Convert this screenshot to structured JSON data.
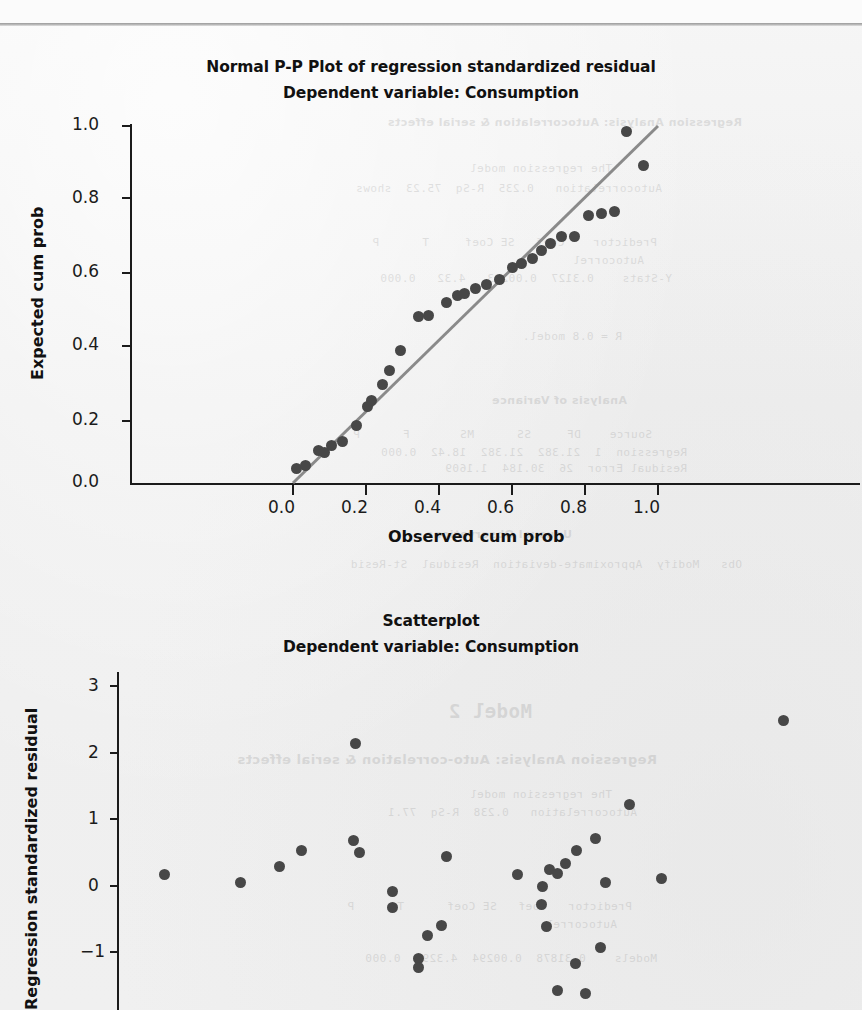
{
  "page": {
    "background_color": "#f1f1f1",
    "dot_color": "#474747",
    "line_color": "#8a8a8a",
    "axis_color": "#1b1b1b"
  },
  "ghost_text": {
    "note": "faint mirrored bleed-through from the reverse side of the scanned page",
    "lines": [
      "Regression Analysis: Autocorrelation & serial effects",
      "The regression model",
      "Autocorrelation   0.235  R-Sq  75.23  shows",
      "Predictor    Coef   SE Coef     T      P",
      "Autocorrel",
      "Y-Stats    0.3127  0.00293   4.32   0.000",
      "R = 0.8 model.",
      "Analysis of Variance",
      "Source    DF     SS      MS       F      P",
      "Regression  1  21.382  21.382  18.42  0.000",
      "Residual Error  26  30.184  1.1609",
      "Unusual Observations",
      "Obs   Modify  Approximate-deviation  Residual  St-Resid",
      "Model 2",
      "Regression Analysis: Auto-correlation & serial effects",
      "The regression model",
      "Autocorrelation   0.238  R-Sq  77.1",
      "Predictor   Coef   SE Coef      T      P",
      "Autocorrel",
      "Models    0.31878  0.00294  4.3291  0.000"
    ]
  },
  "charts": [
    {
      "id": "pp-plot",
      "title": "Normal P-P Plot of regression standardized residual",
      "subtitle": "Dependent variable: Consumption",
      "xlabel": "Observed cum prob",
      "ylabel": "Expected cum prob",
      "xticks": [
        "0.0",
        "0.2",
        "0.4",
        "0.6",
        "0.8",
        "1.0"
      ],
      "yticks": [
        "1.0",
        "0.8",
        "0.6",
        "0.4",
        "0.2",
        "0.0"
      ]
    },
    {
      "id": "scatterplot",
      "title": "Scatterplot",
      "subtitle": "Dependent variable: Consumption",
      "xlabel": "",
      "ylabel": "Regression standardized residual",
      "xticks": [],
      "yticks": [
        "3",
        "2",
        "1",
        "0",
        "−1"
      ]
    }
  ],
  "chart_data": [
    {
      "type": "scatter",
      "id": "pp-plot",
      "title": "Normal P-P Plot of regression standardized residual",
      "subtitle": "Dependent variable: Consumption",
      "xlabel": "Observed cum prob",
      "ylabel": "Expected cum prob",
      "xlim": [
        -0.27,
        1.13
      ],
      "ylim": [
        0.0,
        1.09
      ],
      "xticks": [
        0.0,
        0.2,
        0.4,
        0.6,
        0.8,
        1.0
      ],
      "yticks": [
        0.0,
        0.2,
        0.4,
        0.6,
        0.8,
        1.0
      ],
      "grid": false,
      "legend": null,
      "reference_line": {
        "from": [
          0.0,
          0.0
        ],
        "to": [
          1.0,
          1.0
        ],
        "color": "#8a8a8a"
      },
      "x": [
        0.01,
        0.035,
        0.07,
        0.085,
        0.105,
        0.135,
        0.175,
        0.205,
        0.215,
        0.245,
        0.265,
        0.295,
        0.345,
        0.37,
        0.42,
        0.45,
        0.47,
        0.5,
        0.53,
        0.565,
        0.6,
        0.625,
        0.655,
        0.68,
        0.705,
        0.735,
        0.77,
        0.81,
        0.845,
        0.88,
        0.915,
        0.96
      ],
      "y": [
        0.04,
        0.05,
        0.09,
        0.085,
        0.105,
        0.115,
        0.16,
        0.215,
        0.23,
        0.275,
        0.315,
        0.37,
        0.465,
        0.47,
        0.505,
        0.525,
        0.53,
        0.545,
        0.555,
        0.57,
        0.605,
        0.615,
        0.63,
        0.65,
        0.67,
        0.69,
        0.69,
        0.75,
        0.755,
        0.76,
        0.985,
        0.89
      ]
    },
    {
      "type": "scatter",
      "id": "scatterplot",
      "title": "Scatterplot",
      "subtitle": "Dependent variable: Consumption",
      "xlabel": "",
      "ylabel": "Regression standardized residual",
      "xlim": [
        0.0,
        1.0
      ],
      "ylim": [
        -2.0,
        3.4
      ],
      "yticks": [
        -1,
        0,
        1,
        2,
        3
      ],
      "grid": false,
      "legend": null,
      "note": "x axis labels are cropped off the bottom of the screenshot",
      "points": [
        {
          "x": 0.055,
          "y": 0.17
        },
        {
          "x": 0.16,
          "y": 0.04
        },
        {
          "x": 0.215,
          "y": 0.28
        },
        {
          "x": 0.245,
          "y": 0.52
        },
        {
          "x": 0.32,
          "y": 2.13
        },
        {
          "x": 0.318,
          "y": 0.68
        },
        {
          "x": 0.325,
          "y": 0.5
        },
        {
          "x": 0.372,
          "y": -0.09
        },
        {
          "x": 0.371,
          "y": -0.33
        },
        {
          "x": 0.407,
          "y": -1.1
        },
        {
          "x": 0.407,
          "y": -1.24
        },
        {
          "x": 0.42,
          "y": -0.75
        },
        {
          "x": 0.44,
          "y": -0.6
        },
        {
          "x": 0.447,
          "y": 0.44
        },
        {
          "x": 0.545,
          "y": 0.16
        },
        {
          "x": 0.58,
          "y": -0.02
        },
        {
          "x": 0.59,
          "y": 0.24
        },
        {
          "x": 0.6,
          "y": 0.18
        },
        {
          "x": 0.578,
          "y": -0.28
        },
        {
          "x": 0.585,
          "y": -0.62
        },
        {
          "x": 0.612,
          "y": 0.33
        },
        {
          "x": 0.627,
          "y": 0.53
        },
        {
          "x": 0.625,
          "y": -1.18
        },
        {
          "x": 0.6,
          "y": -1.58
        },
        {
          "x": 0.64,
          "y": -1.62
        },
        {
          "x": 0.654,
          "y": 0.7
        },
        {
          "x": 0.66,
          "y": -0.93
        },
        {
          "x": 0.667,
          "y": 0.05
        },
        {
          "x": 0.7,
          "y": 1.22
        },
        {
          "x": 0.745,
          "y": 0.1
        },
        {
          "x": 0.915,
          "y": 2.48
        }
      ]
    }
  ]
}
